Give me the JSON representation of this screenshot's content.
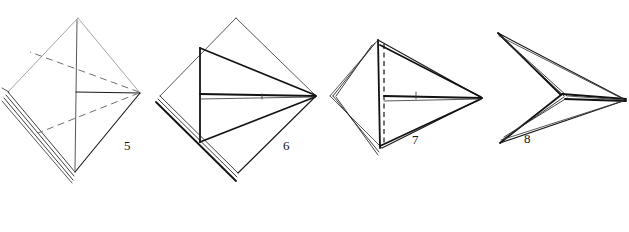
{
  "page": {
    "background_color": "#ffffff",
    "ink_color": "#1a1a1a",
    "width": 629,
    "height": 232,
    "style": "line-art instructional diagram, no shading, hand-inked"
  },
  "figures": [
    {
      "id": "figure-5",
      "label": "5",
      "label_x": 124,
      "label_y": 150,
      "shape": "kite / diamond (square rotated 45 degrees) seen flat",
      "description": "Diamond outline with a solid vertical centre crease, a solid horizontal crease running from centre to the right vertex, and two dashed diagonal creases fanning from the right vertex to the upper-left and lower-left areas. Left and lower-left edges are drawn as several stacked layer lines indicating folded paper thickness.",
      "vertices": {
        "top": [
          78,
          18
        ],
        "right": [
          140,
          93
        ],
        "bottom": [
          75,
          172
        ],
        "left": [
          8,
          92
        ]
      },
      "creases": [
        {
          "type": "valley-solid",
          "from": "top-vertex",
          "to": "bottom-vertex",
          "orientation": "vertical"
        },
        {
          "type": "valley-solid",
          "from": "centre",
          "to": "right-vertex",
          "orientation": "horizontal"
        },
        {
          "type": "hidden-dashed",
          "from": "right-vertex",
          "to": "upper-left"
        },
        {
          "type": "hidden-dashed",
          "from": "right-vertex",
          "to": "lower-left"
        }
      ],
      "layer_edges": 3
    },
    {
      "id": "figure-6",
      "label": "6",
      "label_x": 283,
      "label_y": 150,
      "shape": "kite / diamond with two inner triangular flaps pulled toward the right vertex",
      "description": "Same diamond outline as step 5. A heavy solid vertical line sits left of centre; from its top and bottom ends two long solid lines converge on the right vertex forming a sideways arrowhead. A short horizontal bar runs from the vertical line to the right vertex. Left edges show stacked layers.",
      "vertices": {
        "top": [
          236,
          18
        ],
        "right": [
          316,
          96
        ],
        "bottom": [
          238,
          173
        ],
        "left": [
          160,
          96
        ]
      },
      "inner": {
        "spine_x": 200,
        "spine_top_y": 48,
        "spine_bottom_y": 142
      },
      "layer_edges": 3
    },
    {
      "id": "figure-7",
      "label": "7",
      "label_x": 412,
      "label_y": 144,
      "shape": "narrow kite, flaps folded further, left side compressed",
      "description": "Narrower diamond. A vertical dashed crease sits near the left side with stacked layer lines hugging it. Two long solid lines run from the top and bottom of that crease to the far right point, and a horizontal bar with a small tick crosses the middle.",
      "vertices": {
        "top": [
          378,
          40
        ],
        "right": [
          482,
          98
        ],
        "bottom": [
          382,
          148
        ],
        "left": [
          330,
          96
        ]
      },
      "inner": {
        "dashed_x": 381,
        "dashed_top_y": 44,
        "dashed_bottom_y": 146
      },
      "layer_edges": 4
    },
    {
      "id": "figure-8",
      "label": "8",
      "label_x": 524,
      "label_y": 143,
      "shape": "arrowhead / dart — concave chevron opening to the left, sharp point to the right",
      "description": "A dart shape: top-left and bottom-left corners join a sharp right point, with the left side sunk inward into a chevron notch. Heavy stacked lines run along the chevron and along the horizontal centre spine out to the right point.",
      "vertices": {
        "top_left": [
          498,
          33
        ],
        "right_point": [
          626,
          100
        ],
        "bottom_left": [
          500,
          143
        ],
        "notch": [
          561,
          95
        ]
      },
      "layer_edges": 4
    }
  ],
  "legend": {
    "solid_line_meaning": "visible paper edge or fold already made",
    "dashed_line_meaning": "hidden edge / crease line behind the paper",
    "stacked_lines_meaning": "multiple layers of paper at a folded edge"
  }
}
